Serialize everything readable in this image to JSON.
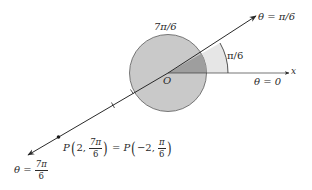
{
  "diagram": {
    "origin_label": "O",
    "axis_label": "x",
    "ray_theta_pi6_label": "θ = π/6",
    "ray_theta_0_label": "θ = 0",
    "angle_label": "π/6",
    "arc_label": "7π/6",
    "ray_theta_7pi6": {
      "theta": "θ",
      "eq": "=",
      "num": "7π",
      "den": "6"
    },
    "point": {
      "name": "P",
      "left_r": "2,",
      "left_num": "7π",
      "left_den": "6",
      "eq": "=",
      "right_name": "P",
      "right_r": "−2,",
      "right_num": "π",
      "right_den": "6"
    },
    "colors": {
      "circle_fill": "#c9c9c9",
      "sector_light": "#e6e6e6",
      "sector_dark": "#9e9e9e",
      "line": "#2a2a2a"
    }
  }
}
